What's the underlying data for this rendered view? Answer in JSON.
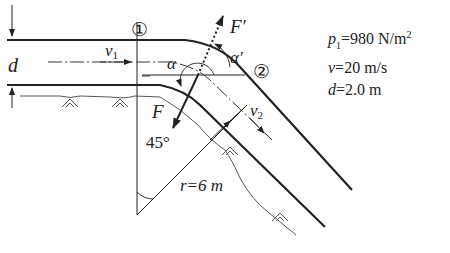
{
  "diagram": {
    "section_labels": {
      "section1": "①",
      "section2": "②"
    },
    "symbols": {
      "diameter": "d",
      "velocity_in": "v",
      "velocity_in_sub": "1",
      "velocity_out": "v",
      "velocity_out_sub": "2",
      "force": "F",
      "reaction_force": "F′",
      "angle": "α",
      "angle_prime": "α′",
      "bend_angle": "45°",
      "radius": "r=6 m"
    },
    "parameters": [
      {
        "symbol": "p",
        "sub": "1",
        "sup": "",
        "value": "=980 N/m",
        "unit_sup": "2"
      },
      {
        "symbol": "v",
        "sub": "",
        "sup": "",
        "value": "=20 m/s",
        "unit_sup": ""
      },
      {
        "symbol": "d",
        "sub": "",
        "sup": "",
        "value": "=2.0 m",
        "unit_sup": ""
      }
    ]
  }
}
